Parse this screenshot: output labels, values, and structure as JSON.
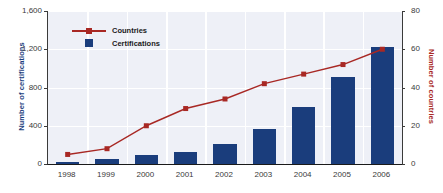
{
  "chart_data": {
    "type": "bar",
    "title": "",
    "subtitle": "",
    "xlabel": "",
    "ylabel": "Number of certifications",
    "y2label": "Number of countries",
    "categories": [
      "1998",
      "1999",
      "2000",
      "2001",
      "2002",
      "2003",
      "2004",
      "2005",
      "2006"
    ],
    "ylim": [
      0,
      1600
    ],
    "y2lim": [
      0,
      80
    ],
    "yticks": [
      "0",
      "400",
      "800",
      "1,200",
      "1,600"
    ],
    "ytick_values": [
      0,
      400,
      800,
      1200,
      1600
    ],
    "y2ticks": [
      "0",
      "20",
      "40",
      "60",
      "80"
    ],
    "y2tick_values": [
      0,
      20,
      40,
      60,
      80
    ],
    "grid": true,
    "legend_position": "upper-left-inside",
    "series": [
      {
        "name": "Certifications",
        "type": "bar",
        "axis": "left",
        "color": "#1a3d7c",
        "values": [
          20,
          50,
          90,
          130,
          210,
          370,
          600,
          910,
          1220
        ]
      },
      {
        "name": "Countries",
        "type": "line",
        "axis": "right",
        "color": "#a82824",
        "marker": "square",
        "values": [
          5,
          8,
          20,
          29,
          34,
          42,
          47,
          52,
          60
        ]
      }
    ]
  },
  "legend": {
    "items": [
      {
        "label": "Countries"
      },
      {
        "label": "Certifications"
      }
    ]
  },
  "colors": {
    "bar": "#1a3d7c",
    "line": "#a82824",
    "plot_background": "#eef0f7",
    "gridline": "#ffffff",
    "axis": "#3a3a3a",
    "tick_text": "#3a3a3a"
  }
}
